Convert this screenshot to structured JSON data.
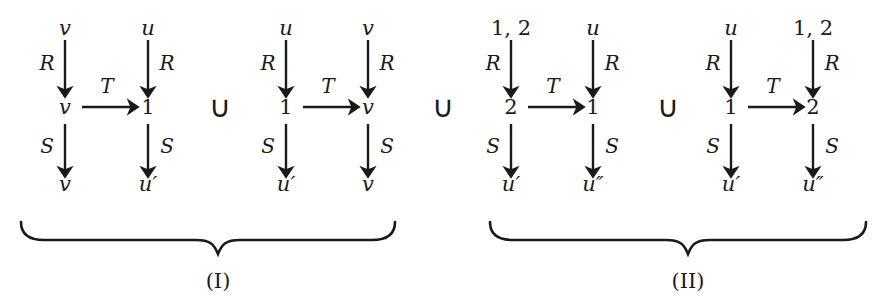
{
  "figure": {
    "type": "commutative-diagram-union",
    "union_symbol": "∪",
    "horizontal_edge_label": "T",
    "vertical_left_edge_label": "R",
    "vertical_right_edge_label": "S",
    "ink_color": "#1a1a1a",
    "background_color": "#ffffff"
  },
  "squares": [
    {
      "id": "square-1",
      "group": "I",
      "top_left": "v",
      "top_right": "u",
      "mid_left": "v",
      "mid_right": "1",
      "bottom_left": "v",
      "bottom_right": "u′",
      "left_upper_label": "R",
      "right_upper_label": "R",
      "left_lower_label": "S",
      "right_lower_label": "S",
      "horizontal_label": "T"
    },
    {
      "id": "square-2",
      "group": "I",
      "top_left": "u",
      "top_right": "v",
      "mid_left": "1",
      "mid_right": "v",
      "bottom_left": "u′",
      "bottom_right": "v",
      "left_upper_label": "R",
      "right_upper_label": "R",
      "left_lower_label": "S",
      "right_lower_label": "S",
      "horizontal_label": "T"
    },
    {
      "id": "square-3",
      "group": "II",
      "top_left": "1, 2",
      "top_right": "u",
      "mid_left": "2",
      "mid_right": "1",
      "bottom_left": "u′",
      "bottom_right": "u″",
      "left_upper_label": "R",
      "right_upper_label": "R",
      "left_lower_label": "S",
      "right_lower_label": "S",
      "horizontal_label": "T"
    },
    {
      "id": "square-4",
      "group": "II",
      "top_left": "u",
      "top_right": "1, 2",
      "mid_left": "1",
      "mid_right": "2",
      "bottom_left": "u′",
      "bottom_right": "u″",
      "left_upper_label": "R",
      "right_upper_label": "R",
      "left_lower_label": "S",
      "right_lower_label": "S",
      "horizontal_label": "T"
    }
  ],
  "unions": [
    {
      "id": "union-1",
      "symbol": "∪"
    },
    {
      "id": "union-2",
      "symbol": "∪"
    },
    {
      "id": "union-3",
      "symbol": "∪"
    }
  ],
  "braces": [
    {
      "id": "brace-I",
      "caption": "(I)"
    },
    {
      "id": "brace-II",
      "caption": "(II)"
    }
  ]
}
